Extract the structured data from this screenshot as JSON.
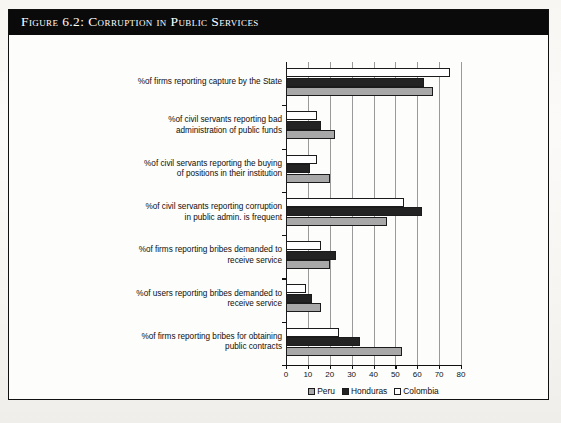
{
  "figure": {
    "title": "Figure 6.2:  Corruption in Public Services"
  },
  "legend": {
    "items": [
      {
        "label": "Peru",
        "color": "#a8a8a8",
        "icon": "legend-swatch-peru"
      },
      {
        "label": "Honduras",
        "color": "#232323",
        "icon": "legend-swatch-honduras"
      },
      {
        "label": "Colombia",
        "color": "#ffffff",
        "icon": "legend-swatch-colombia"
      }
    ]
  },
  "chart_data": {
    "type": "bar",
    "orientation": "horizontal",
    "title": "Corruption in Public Services",
    "xlabel": "",
    "ylabel": "",
    "xlim": [
      0,
      80
    ],
    "xticks": [
      0,
      10,
      20,
      30,
      40,
      50,
      60,
      70,
      80
    ],
    "xticklabels": [
      "0",
      "10",
      "20",
      "30",
      "40",
      "50",
      "60",
      "70",
      "80"
    ],
    "grid": "vertical",
    "legend_position": "bottom-center",
    "categories": [
      "%of firms reporting capture by the State",
      "%of civil servants reporting bad\nadministration of public funds",
      "%of civil servants reporting the buying\nof positions in their institution",
      "%of civil servants reporting corruption\nin public admin. is frequent",
      "%of firms reporting bribes demanded to\nreceive service",
      "%of users reporting bribes demanded to\nreceive service",
      "%of firms reporting bribes for obtaining\npublic contracts"
    ],
    "series": [
      {
        "name": "Peru",
        "color": "#a8a8a8",
        "values": [
          67,
          22.5,
          20,
          46,
          20,
          16,
          53
        ]
      },
      {
        "name": "Honduras",
        "color": "#232323",
        "values": [
          63,
          16,
          11,
          62,
          23,
          12,
          34
        ]
      },
      {
        "name": "Colombia",
        "color": "#ffffff",
        "values": [
          75,
          14,
          14,
          54,
          16,
          9,
          24
        ]
      }
    ]
  }
}
